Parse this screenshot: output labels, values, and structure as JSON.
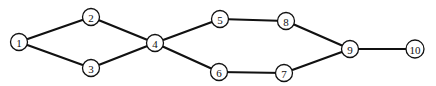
{
  "diagram": {
    "type": "network-graph",
    "colors": {
      "stroke": "#111111",
      "background": "#ffffff",
      "node_fill": "#ffffff"
    },
    "node_radius": 8.5,
    "nodes": [
      {
        "id": "1",
        "label": "1",
        "x": 19,
        "y": 42
      },
      {
        "id": "2",
        "label": "2",
        "x": 91,
        "y": 17
      },
      {
        "id": "3",
        "label": "3",
        "x": 91,
        "y": 68
      },
      {
        "id": "4",
        "label": "4",
        "x": 155,
        "y": 43
      },
      {
        "id": "5",
        "label": "5",
        "x": 220,
        "y": 19
      },
      {
        "id": "6",
        "label": "6",
        "x": 219,
        "y": 72
      },
      {
        "id": "7",
        "label": "7",
        "x": 284,
        "y": 73
      },
      {
        "id": "8",
        "label": "8",
        "x": 286,
        "y": 21
      },
      {
        "id": "9",
        "label": "9",
        "x": 350,
        "y": 49
      },
      {
        "id": "10",
        "label": "10",
        "x": 415,
        "y": 49
      }
    ],
    "edges": [
      {
        "from": "1",
        "to": "2"
      },
      {
        "from": "1",
        "to": "3"
      },
      {
        "from": "2",
        "to": "4"
      },
      {
        "from": "3",
        "to": "4"
      },
      {
        "from": "4",
        "to": "5"
      },
      {
        "from": "4",
        "to": "6"
      },
      {
        "from": "5",
        "to": "8"
      },
      {
        "from": "6",
        "to": "7"
      },
      {
        "from": "8",
        "to": "9"
      },
      {
        "from": "7",
        "to": "9"
      },
      {
        "from": "9",
        "to": "10"
      }
    ]
  }
}
